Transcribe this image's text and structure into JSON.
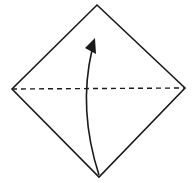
{
  "diagram": {
    "type": "origami-fold-step",
    "background": "#ffffff",
    "stroke_color": "#1a1a1a",
    "shape": {
      "name": "square-paper-diamond",
      "vertices": {
        "top": [
          97,
          5
        ],
        "right": [
          185,
          88
        ],
        "bottom": [
          99,
          177
        ],
        "left": [
          12,
          89
        ]
      }
    },
    "fold_line": {
      "style": "valley-fold-dashed",
      "from": [
        12,
        89
      ],
      "to": [
        185,
        88
      ]
    },
    "arrow": {
      "meaning": "fold-bottom-corner-up",
      "from": [
        99,
        175
      ],
      "to": [
        94,
        40
      ],
      "curve_control": [
        80,
        110
      ]
    }
  }
}
